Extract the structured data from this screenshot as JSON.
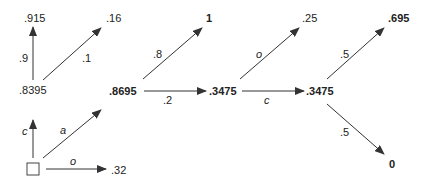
{
  "diagram": {
    "nodes": {
      "start": "",
      "n_top_left": ".915",
      "n_top_left2": ".16",
      "n_left_mid": ".8395",
      "n_bottom_right_of_start": ".32",
      "n_mid1": ".8695",
      "n_mid1_up": "1",
      "n_mid2": ".3475",
      "n_mid2_up": ".25",
      "n_mid3": ".3475",
      "n_mid3_up": ".695",
      "n_mid3_down": "0"
    },
    "edges": {
      "start_to_8395": "c",
      "start_to_8695": "a",
      "start_to_32": "o",
      "e8395_to_915": ".9",
      "e8395_to_16": ".1",
      "e8695_to_1": ".8",
      "e8695_to_3475": ".2",
      "e3475_to_25": "o",
      "e3475_to_3475": "c",
      "e3475b_to_695": ".5",
      "e3475b_to_0": ".5"
    },
    "colors": {
      "line": "#333333",
      "text": "#222222"
    }
  }
}
